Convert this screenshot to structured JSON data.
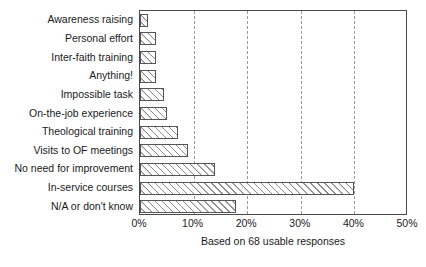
{
  "chart_data": {
    "type": "bar",
    "orientation": "horizontal",
    "title": "",
    "subtitle": "",
    "xlabel": "",
    "ylabel": "",
    "caption": "Based on 68 usable responses",
    "categories": [
      "Awareness raising",
      "Personal effort",
      "Inter-faith training",
      "Anything!",
      "Impossible task",
      "On-the-job experience",
      "Theological training",
      "Visits to OF meetings",
      "No need for improvement",
      "In-service courses",
      "N/A or don't know"
    ],
    "values": [
      1.5,
      3,
      3,
      3,
      4.5,
      5,
      7,
      9,
      14,
      40,
      18
    ],
    "value_unit": "%",
    "xlim": [
      0,
      50
    ],
    "xticks": [
      0,
      10,
      20,
      30,
      40,
      50
    ],
    "xtick_labels": [
      "0%",
      "10%",
      "20%",
      "30%",
      "40%",
      "50%"
    ],
    "grid": "vertical-dashed",
    "legend": "none",
    "bar_fill": "diagonal-hatch",
    "bar_edge_color": "#555555",
    "grid_color": "#9a9a9a",
    "frame_color": "#4a4a4a",
    "n_responses": 68
  }
}
